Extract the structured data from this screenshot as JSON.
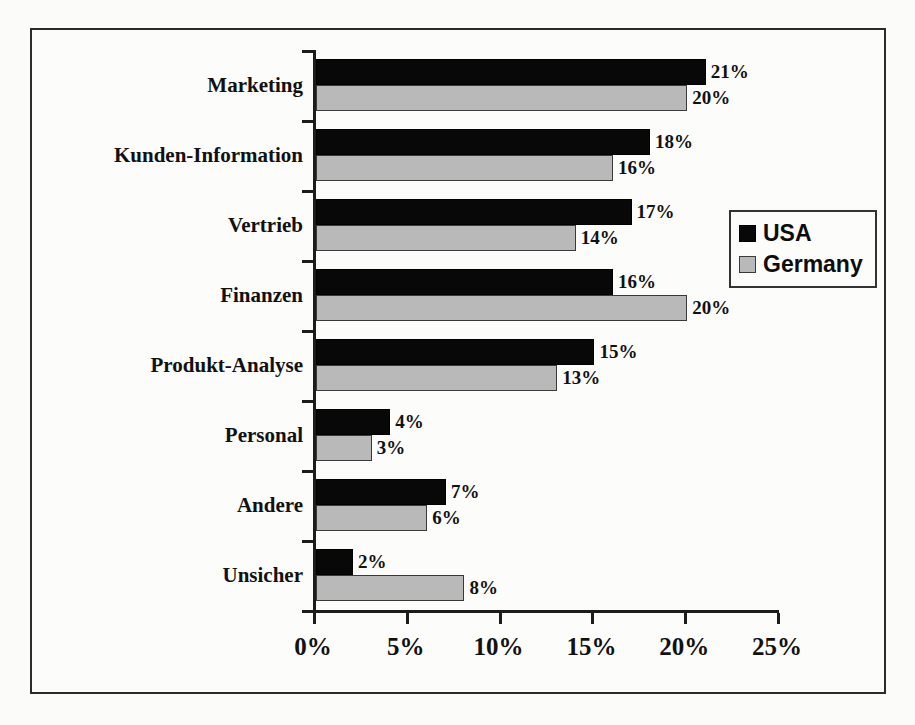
{
  "chart_data": {
    "type": "bar",
    "orientation": "horizontal",
    "title": "",
    "xlabel": "",
    "ylabel": "",
    "xlim": [
      0,
      25
    ],
    "x_tick_labels": [
      "0%",
      "5%",
      "10%",
      "15%",
      "20%",
      "25%"
    ],
    "x_ticks": [
      0,
      5,
      10,
      15,
      20,
      25
    ],
    "grid": false,
    "legend_position": "right-upper-inside",
    "categories": [
      "Marketing",
      "Kunden-Information",
      "Vertrieb",
      "Finanzen",
      "Produkt-Analyse",
      "Personal",
      "Andere",
      "Unsicher"
    ],
    "series": [
      {
        "name": "USA",
        "color": "#080808",
        "values": [
          21,
          18,
          17,
          16,
          15,
          4,
          7,
          2
        ],
        "value_labels": [
          "21%",
          "18%",
          "17%",
          "16%",
          "15%",
          "4%",
          "7%",
          "2%"
        ]
      },
      {
        "name": "Germany",
        "color": "#b9b9b9",
        "values": [
          20,
          16,
          14,
          20,
          13,
          3,
          6,
          8
        ],
        "value_labels": [
          "20%",
          "16%",
          "14%",
          "20%",
          "13%",
          "3%",
          "6%",
          "8%"
        ]
      }
    ]
  },
  "legend": {
    "entries": [
      {
        "label": "USA",
        "swatch": "black-square-swatch"
      },
      {
        "label": "Germany",
        "swatch": "gray-square-swatch"
      }
    ]
  },
  "colors": {
    "series_usa": "#080808",
    "series_germany": "#b9b9b9",
    "axis": "#1c1c1c",
    "text": "#111111",
    "background": "#fcfcfa",
    "border": "#2b2b2b"
  }
}
